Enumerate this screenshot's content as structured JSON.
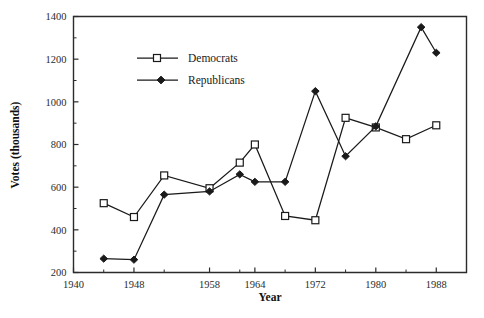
{
  "chart_data": {
    "type": "line",
    "title": "",
    "subtitle": "",
    "xlabel": "Year",
    "ylabel": "Votes (thousands)",
    "xlim": [
      1940,
      1992
    ],
    "ylim": [
      200,
      1400
    ],
    "grid": false,
    "legend_position": "upper-left-inside",
    "x_tick_labels": [
      "1940",
      "1948",
      "1958",
      "1964",
      "1972",
      "1980",
      "1988"
    ],
    "x_tick_values": [
      1940,
      1948,
      1958,
      1964,
      1972,
      1980,
      1988
    ],
    "x_minor_ticks": [
      1944,
      1952,
      1962,
      1968,
      1976,
      1984
    ],
    "y_tick_labels": [
      "200",
      "400",
      "600",
      "800",
      "1000",
      "1200",
      "1400"
    ],
    "y_tick_values": [
      200,
      400,
      600,
      800,
      1000,
      1200,
      1400
    ],
    "y_minor_ticks": [
      300,
      500,
      700,
      900,
      1100,
      1300
    ],
    "series": [
      {
        "name": "Democrats",
        "marker": "open-square",
        "x": [
          1944,
          1948,
          1952,
          1958,
          1962,
          1964,
          1968,
          1972,
          1976,
          1980,
          1984,
          1988
        ],
        "values": [
          525,
          460,
          655,
          595,
          715,
          800,
          465,
          445,
          925,
          880,
          825,
          890
        ]
      },
      {
        "name": "Republicans",
        "marker": "filled-diamond",
        "x": [
          1944,
          1948,
          1952,
          1958,
          1962,
          1964,
          1968,
          1972,
          1976,
          1980,
          1986,
          1988
        ],
        "values": [
          265,
          260,
          565,
          580,
          660,
          625,
          625,
          1050,
          745,
          885,
          1350,
          1230
        ]
      }
    ]
  },
  "legend": {
    "entries": [
      {
        "label": "Democrats"
      },
      {
        "label": "Republicans"
      }
    ]
  },
  "axes": {
    "x_title": "Year",
    "y_title": "Votes (thousands)"
  }
}
